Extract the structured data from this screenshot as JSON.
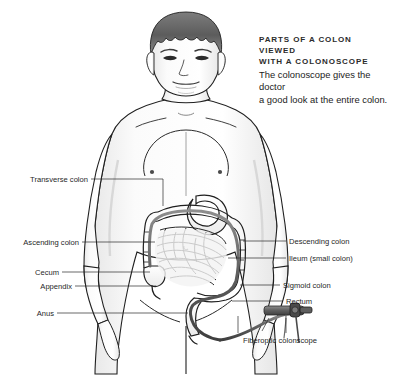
{
  "figure": {
    "title_line1": "Parts of a colon viewed",
    "title_line2": "with a colonoscope",
    "description_line1": "The colonoscope gives the doctor",
    "description_line2": "a good look at the entire colon.",
    "style": "grayscale-line-art",
    "background_color": "#ffffff",
    "ink_color": "#1f1f1f",
    "scope_color": "#6b6b6b"
  },
  "labels_left": [
    {
      "text": "Transverse colon",
      "y": 179
    },
    {
      "text": "Ascending colon",
      "y": 242
    },
    {
      "text": "Cecum",
      "y": 272
    },
    {
      "text": "Appendix",
      "y": 286
    },
    {
      "text": "Anus",
      "y": 313
    }
  ],
  "labels_right": [
    {
      "text": "Descending colon",
      "y": 241
    },
    {
      "text": "Ileum (small colon)",
      "y": 258
    },
    {
      "text": "Sigmoid colon",
      "y": 285
    },
    {
      "text": "Rectum",
      "y": 301
    }
  ],
  "labels_bottom": [
    {
      "text": "Fiberoptic colonscope",
      "x": 243,
      "y": 340
    }
  ]
}
